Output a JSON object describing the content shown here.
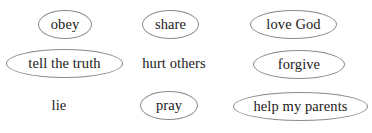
{
  "page": {
    "background_color": "#ffffff",
    "text_color": "#1a1a1a",
    "ellipse_stroke_color": "#8a8a8a",
    "width": 372,
    "height": 133
  },
  "items": [
    {
      "id": "obey",
      "label": "obey",
      "circled": true,
      "row": 1,
      "column": 1,
      "x": 38,
      "y": 10,
      "width": 54,
      "height": 29
    },
    {
      "id": "share",
      "label": "share",
      "circled": true,
      "row": 1,
      "column": 2,
      "x": 142,
      "y": 10,
      "width": 57,
      "height": 29
    },
    {
      "id": "love-god",
      "label": "love God",
      "circled": true,
      "row": 1,
      "column": 3,
      "x": 250,
      "y": 10,
      "width": 87,
      "height": 29
    },
    {
      "id": "tell-the-truth",
      "label": "tell the truth",
      "circled": true,
      "row": 2,
      "column": 1,
      "x": 6,
      "y": 49,
      "width": 117,
      "height": 29
    },
    {
      "id": "hurt-others",
      "label": "hurt others",
      "circled": false,
      "row": 2,
      "column": 2,
      "x": 133,
      "y": 49,
      "width": 82,
      "height": 29
    },
    {
      "id": "forgive",
      "label": "forgive",
      "circled": true,
      "row": 2,
      "column": 3,
      "x": 253,
      "y": 50,
      "width": 92,
      "height": 29
    },
    {
      "id": "lie",
      "label": "lie",
      "circled": false,
      "row": 3,
      "column": 1,
      "x": 36,
      "y": 91,
      "width": 46,
      "height": 29
    },
    {
      "id": "pray",
      "label": "pray",
      "circled": true,
      "row": 3,
      "column": 2,
      "x": 140,
      "y": 91,
      "width": 58,
      "height": 29
    },
    {
      "id": "help-my-parents",
      "label": "help my parents",
      "circled": true,
      "row": 3,
      "column": 3,
      "x": 233,
      "y": 92,
      "width": 135,
      "height": 29
    }
  ]
}
